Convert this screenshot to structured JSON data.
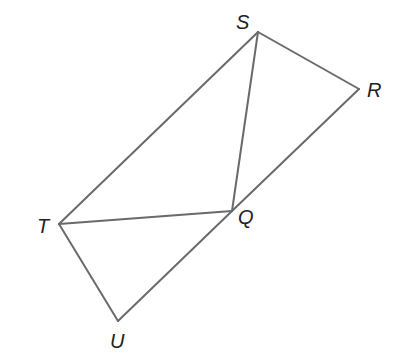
{
  "diagram": {
    "type": "geometry-figure",
    "stroke_color": "#6a6a6a",
    "label_color": "#222222",
    "vertices": {
      "S": {
        "label": "S",
        "x": 258,
        "y": 32
      },
      "R": {
        "label": "R",
        "x": 359,
        "y": 89
      },
      "Q": {
        "label": "Q",
        "x": 232,
        "y": 211
      },
      "T": {
        "label": "T",
        "x": 59,
        "y": 224
      },
      "U": {
        "label": "U",
        "x": 118,
        "y": 321
      }
    },
    "labels": {
      "S": {
        "text": "S",
        "x": 236,
        "y": 29
      },
      "R": {
        "text": "R",
        "x": 367,
        "y": 97
      },
      "Q": {
        "text": "Q",
        "x": 238,
        "y": 224
      },
      "T": {
        "text": "T",
        "x": 37,
        "y": 233
      },
      "U": {
        "text": "U",
        "x": 110,
        "y": 348
      }
    },
    "segments": [
      {
        "name": "ST",
        "from": "S",
        "to": "T"
      },
      {
        "name": "SR",
        "from": "S",
        "to": "R"
      },
      {
        "name": "SQ",
        "from": "S",
        "to": "Q"
      },
      {
        "name": "RQ",
        "from": "R",
        "to": "Q"
      },
      {
        "name": "QU",
        "from": "Q",
        "to": "U"
      },
      {
        "name": "TQ",
        "from": "T",
        "to": "Q"
      },
      {
        "name": "TU",
        "from": "T",
        "to": "U"
      }
    ]
  }
}
